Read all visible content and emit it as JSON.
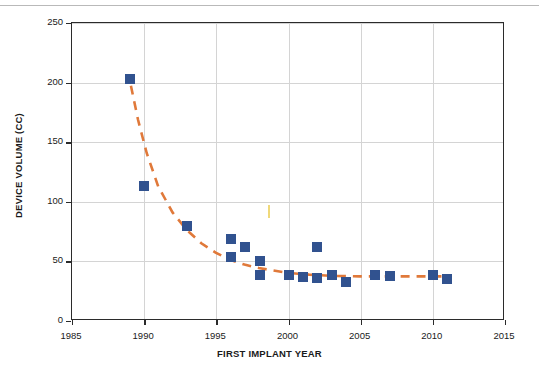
{
  "figure": {
    "top_rule": true,
    "background": "#ffffff"
  },
  "chart_data": {
    "type": "scatter",
    "title": "",
    "xlabel": "FIRST IMPLANT YEAR",
    "ylabel": "DEVICE VOLUME (CC)",
    "xlim": [
      1985,
      2015
    ],
    "ylim": [
      0,
      250
    ],
    "xticks": [
      1985,
      1990,
      1995,
      2000,
      2005,
      2010,
      2015
    ],
    "xticklabels": [
      "1985",
      "1990",
      "1995",
      "2000",
      "2005",
      "2010",
      "2015"
    ],
    "yticks": [
      0,
      50,
      100,
      150,
      200,
      250
    ],
    "yticklabels": [
      "0",
      "50",
      "100",
      "150",
      "200",
      "250"
    ],
    "grid": true,
    "legend": false,
    "marker": {
      "shape": "square",
      "color": "#31528F",
      "size": 10
    },
    "series": [
      {
        "name": "Device volume",
        "points": [
          {
            "x": 1989,
            "y": 203
          },
          {
            "x": 1990,
            "y": 113
          },
          {
            "x": 1993,
            "y": 80
          },
          {
            "x": 1996,
            "y": 69
          },
          {
            "x": 1996,
            "y": 54
          },
          {
            "x": 1997,
            "y": 62
          },
          {
            "x": 1998,
            "y": 50
          },
          {
            "x": 1998,
            "y": 39
          },
          {
            "x": 2000,
            "y": 39
          },
          {
            "x": 2001,
            "y": 37
          },
          {
            "x": 2002,
            "y": 62
          },
          {
            "x": 2002,
            "y": 36
          },
          {
            "x": 2003,
            "y": 39
          },
          {
            "x": 2004,
            "y": 33
          },
          {
            "x": 2006,
            "y": 39
          },
          {
            "x": 2007,
            "y": 38
          },
          {
            "x": 2010,
            "y": 39
          },
          {
            "x": 2011,
            "y": 35
          }
        ]
      }
    ],
    "trendline": {
      "style": "dashed",
      "color": "#E0793A",
      "width": 2.6,
      "description": "exponential decay fit",
      "points": [
        {
          "x": 1989.1,
          "y": 197
        },
        {
          "x": 1989.6,
          "y": 168
        },
        {
          "x": 1990.2,
          "y": 140
        },
        {
          "x": 1991.0,
          "y": 112
        },
        {
          "x": 1992.0,
          "y": 90
        },
        {
          "x": 1993.0,
          "y": 75
        },
        {
          "x": 1994.0,
          "y": 64
        },
        {
          "x": 1995.0,
          "y": 56
        },
        {
          "x": 1996.0,
          "y": 50
        },
        {
          "x": 1997.0,
          "y": 46
        },
        {
          "x": 1998.0,
          "y": 43
        },
        {
          "x": 1999.0,
          "y": 41
        },
        {
          "x": 2000.0,
          "y": 39
        },
        {
          "x": 2001.5,
          "y": 37.5
        },
        {
          "x": 2003.0,
          "y": 36.5
        },
        {
          "x": 2005.0,
          "y": 36
        },
        {
          "x": 2007.0,
          "y": 36
        },
        {
          "x": 2009.0,
          "y": 36
        },
        {
          "x": 2011.2,
          "y": 36
        }
      ]
    },
    "annotations": [
      {
        "name": "stray-tick-mark",
        "x": 1998.6,
        "y_top": 97,
        "color": "#F0D97A"
      }
    ]
  }
}
